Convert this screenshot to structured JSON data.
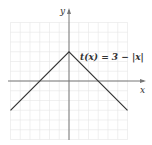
{
  "chart_data": {
    "type": "line",
    "title": "",
    "xlabel": "x",
    "ylabel": "y",
    "function_label": "t(x) = 3 − |x|",
    "series": [
      {
        "name": "t(x) = 3 − |x|",
        "x": [
          -6,
          0,
          6
        ],
        "y": [
          -3,
          3,
          -3
        ]
      }
    ],
    "xlim": [
      -6,
      6
    ],
    "ylim": [
      -6,
      6
    ],
    "grid": true,
    "colors": {
      "line": "#333333",
      "axes": "#666666",
      "grid": "#e6e6e6"
    }
  },
  "labels": {
    "x_axis": "x",
    "y_axis": "y",
    "function": "t(x) = 3 − |x|"
  }
}
